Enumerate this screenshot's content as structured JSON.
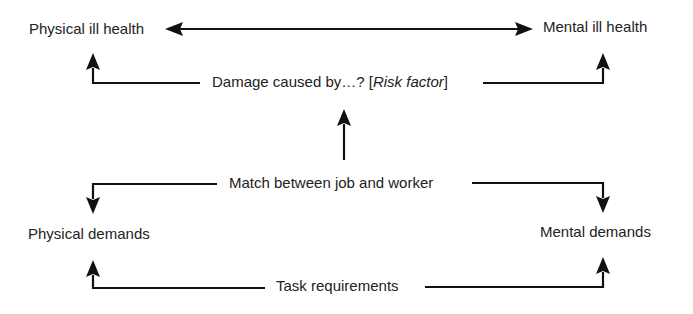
{
  "diagram": {
    "nodes": {
      "physical_ill_health": "Physical ill health",
      "mental_ill_health": "Mental ill health",
      "damage_prefix": "Damage caused by…? [",
      "damage_risk": "Risk factor",
      "damage_suffix": "]",
      "match": "Match between job and worker",
      "physical_demands": "Physical demands",
      "mental_demands": "Mental demands",
      "task_requirements": "Task requirements"
    },
    "edges": [
      {
        "from": "physical_ill_health",
        "to": "mental_ill_health",
        "type": "bidirectional"
      },
      {
        "from": "damage_caused_by",
        "to": "physical_ill_health"
      },
      {
        "from": "damage_caused_by",
        "to": "mental_ill_health"
      },
      {
        "from": "match",
        "to": "damage_caused_by"
      },
      {
        "from": "match",
        "to": "physical_demands"
      },
      {
        "from": "match",
        "to": "mental_demands"
      },
      {
        "from": "task_requirements",
        "to": "physical_demands"
      },
      {
        "from": "task_requirements",
        "to": "mental_demands"
      }
    ],
    "colors": {
      "line": "#111111",
      "text": "#222222",
      "background": "#ffffff"
    }
  }
}
